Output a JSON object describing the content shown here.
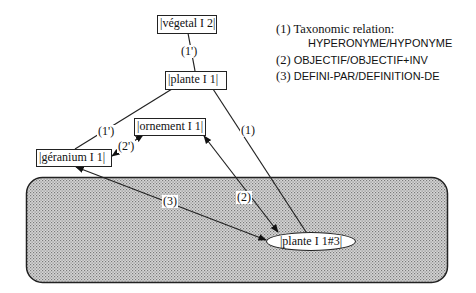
{
  "nodes": {
    "vegetal": "|végetal I 2|",
    "plante": "|plante I 1|",
    "ornement": "|ornement I 1|",
    "geranium": "|géranium I 1|",
    "plante_instance": "|plante I 1#3|"
  },
  "edge_labels": {
    "vegetal_plante": "(1')",
    "plante_geranium": "(1')",
    "geranium_ornement": "(2')",
    "plante_instance": "(1)",
    "ornement_instance": "(2)",
    "geranium_instance": "(3)"
  },
  "legend": {
    "item1_prefix": "(1) Taxonomic relation:",
    "item1_detail": "HYPERONYME/HYPONYME",
    "item2_prefix": "(2) ",
    "item2_detail": "OBJECTIF/OBJECTIF+INV",
    "item3_prefix": "(3) ",
    "item3_detail": "DEFINI-PAR/DEFINITION-DE"
  },
  "colors": {
    "line": "#222222",
    "region_fill": "#bdbdbd"
  }
}
